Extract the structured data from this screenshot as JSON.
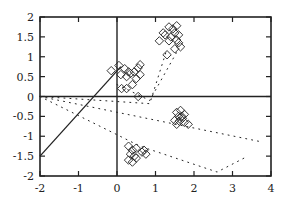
{
  "chart_data": {
    "type": "scatter",
    "title": "",
    "xlabel": "",
    "ylabel": "",
    "xlim": [
      -2,
      4
    ],
    "ylim": [
      -2,
      2
    ],
    "grid": false,
    "legend": null,
    "xticks": [
      "-2",
      "-1",
      "0",
      "1",
      "2",
      "3",
      "4"
    ],
    "yticks": [
      "-2",
      "-1.5",
      "-1",
      "-0.5",
      "0",
      "0.5",
      "1",
      "1.5",
      "2"
    ],
    "zero_axes": true,
    "marker": "diamond",
    "series": [
      {
        "name": "cluster-upper-left",
        "points": [
          [
            -0.15,
            0.65
          ],
          [
            0.05,
            0.78
          ],
          [
            0.1,
            0.55
          ],
          [
            0.2,
            0.7
          ],
          [
            0.3,
            0.62
          ],
          [
            0.25,
            0.5
          ],
          [
            0.35,
            0.58
          ],
          [
            0.45,
            0.62
          ],
          [
            0.55,
            0.72
          ],
          [
            0.6,
            0.8
          ],
          [
            0.5,
            0.45
          ],
          [
            0.4,
            0.3
          ],
          [
            0.25,
            0.2
          ],
          [
            0.12,
            0.2
          ],
          [
            0.6,
            0.55
          ],
          [
            0.55,
            0.0
          ]
        ]
      },
      {
        "name": "cluster-upper-right",
        "points": [
          [
            1.2,
            1.6
          ],
          [
            1.35,
            1.75
          ],
          [
            1.45,
            1.7
          ],
          [
            1.55,
            1.78
          ],
          [
            1.5,
            1.6
          ],
          [
            1.4,
            1.5
          ],
          [
            1.6,
            1.55
          ],
          [
            1.55,
            1.42
          ],
          [
            1.35,
            1.4
          ],
          [
            1.1,
            1.4
          ],
          [
            1.25,
            1.55
          ],
          [
            1.6,
            1.35
          ],
          [
            1.65,
            1.25
          ],
          [
            1.5,
            1.2
          ],
          [
            1.3,
            1.05
          ]
        ]
      },
      {
        "name": "cluster-lower-right",
        "points": [
          [
            1.55,
            -0.4
          ],
          [
            1.65,
            -0.35
          ],
          [
            1.75,
            -0.45
          ],
          [
            1.6,
            -0.5
          ],
          [
            1.7,
            -0.55
          ],
          [
            1.5,
            -0.6
          ],
          [
            1.62,
            -0.62
          ],
          [
            1.55,
            -0.7
          ],
          [
            1.68,
            -0.5
          ],
          [
            1.85,
            -0.7
          ],
          [
            1.75,
            -0.65
          ]
        ]
      },
      {
        "name": "cluster-lower-middle",
        "points": [
          [
            0.3,
            -1.25
          ],
          [
            0.4,
            -1.35
          ],
          [
            0.5,
            -1.3
          ],
          [
            0.35,
            -1.45
          ],
          [
            0.45,
            -1.5
          ],
          [
            0.3,
            -1.6
          ],
          [
            0.4,
            -1.65
          ],
          [
            0.5,
            -1.55
          ],
          [
            0.65,
            -1.4
          ],
          [
            0.75,
            -1.45
          ],
          [
            0.7,
            -1.35
          ]
        ]
      }
    ],
    "lines": [
      {
        "name": "solid-line",
        "style": "solid",
        "points": [
          [
            -2,
            -1.5
          ],
          [
            0.1,
            0.75
          ]
        ]
      },
      {
        "name": "dotted-line-1",
        "style": "dotted",
        "points": [
          [
            -2,
            0
          ],
          [
            0.85,
            -0.18
          ],
          [
            1.3,
            1.2
          ]
        ]
      },
      {
        "name": "dotted-line-2",
        "style": "dotted",
        "points": [
          [
            0,
            0.3
          ],
          [
            0.85,
            -0.1
          ],
          [
            1.6,
            1.2
          ]
        ]
      },
      {
        "name": "dotted-line-3",
        "style": "dotted",
        "points": [
          [
            -2,
            0
          ],
          [
            3.8,
            -1.15
          ]
        ]
      },
      {
        "name": "dotted-line-4",
        "style": "dotted",
        "points": [
          [
            -2,
            0
          ],
          [
            0.6,
            -1.25
          ],
          [
            2.6,
            -1.9
          ],
          [
            3.3,
            -1.55
          ]
        ]
      }
    ]
  }
}
